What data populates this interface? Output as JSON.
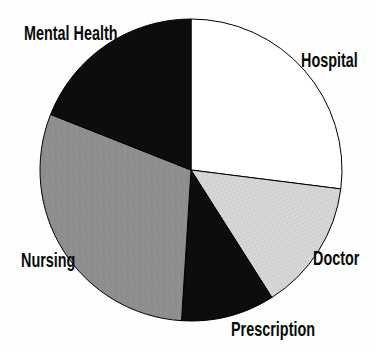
{
  "chart_data": {
    "type": "pie",
    "unit": "percent",
    "legend": "none",
    "labels_position": "outside",
    "start_angle_deg": -90,
    "direction": "clockwise",
    "center": [
      191,
      170
    ],
    "radius": 151,
    "outline_color": "#000000",
    "background_color": "#fefefe",
    "slices": [
      {
        "label": "Hospital",
        "value": 27,
        "color": "#ffffff",
        "texture": "none"
      },
      {
        "label": "Doctor",
        "value": 14,
        "color": "#d6d6d6",
        "texture": "halftone"
      },
      {
        "label": "Prescription",
        "value": 10,
        "color": "#0d0d0d",
        "texture": "none"
      },
      {
        "label": "Nursing",
        "value": 30,
        "color": "#8e8e8e",
        "texture": "noise"
      },
      {
        "label": "Mental Health",
        "value": 19,
        "color": "#0d0d0d",
        "texture": "none"
      }
    ]
  }
}
